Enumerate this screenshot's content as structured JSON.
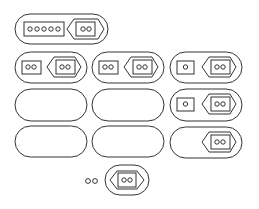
{
  "diagram": {
    "stroke_color": "#333333",
    "background": "#ffffff",
    "top": {
      "box_circles": 5,
      "arrow_circles": 2
    },
    "grid": [
      [
        {
          "box_circles": 2,
          "arrow_circles": 2
        },
        {
          "box_circles": 2,
          "arrow_circles": 2
        },
        {
          "box_circles": 1,
          "arrow_circles": 2
        }
      ],
      [
        {
          "box_circles": 0,
          "arrow_circles": 0
        },
        {
          "box_circles": 0,
          "arrow_circles": 0
        },
        {
          "box_circles": 1,
          "arrow_circles": 2
        }
      ],
      [
        {
          "box_circles": 0,
          "arrow_circles": 0
        },
        {
          "box_circles": 0,
          "arrow_circles": 0
        },
        {
          "box_circles": 0,
          "arrow_circles": 2
        }
      ]
    ],
    "answer": {
      "loose_circles": 2,
      "arrow_circles": 2
    }
  }
}
